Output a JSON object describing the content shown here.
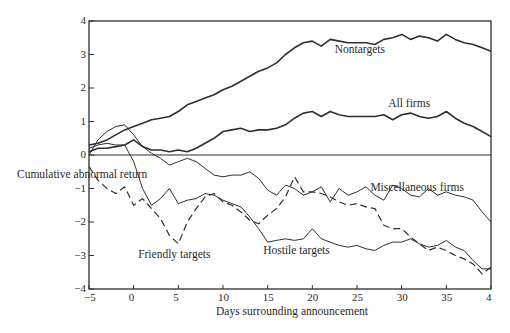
{
  "chart_data": {
    "type": "line",
    "title": "",
    "xlabel": "Days surrounding announcement",
    "ylabel": "Cumulative abnormal return",
    "xlim": [
      -5,
      40
    ],
    "ylim": [
      -4,
      4
    ],
    "x_ticks": [
      -5,
      0,
      5,
      10,
      15,
      20,
      25,
      30,
      35,
      40
    ],
    "x_tick_labels": [
      "−5",
      "0",
      "5",
      "10",
      "15",
      "20",
      "25",
      "30",
      "35",
      "4"
    ],
    "y_ticks": [
      4,
      3,
      2,
      1,
      0,
      -1,
      -2,
      -3,
      -4
    ],
    "y_tick_labels": [
      "4",
      "3",
      "2",
      "1",
      "0",
      "−1",
      "−2",
      "−3",
      "−4"
    ],
    "grid": false,
    "legend": "inline annotations",
    "x": [
      -5,
      -4,
      -3,
      -2,
      -1,
      0,
      1,
      2,
      3,
      4,
      5,
      6,
      7,
      8,
      9,
      10,
      11,
      12,
      13,
      14,
      15,
      16,
      17,
      18,
      19,
      20,
      21,
      22,
      23,
      24,
      25,
      26,
      27,
      28,
      29,
      30,
      31,
      32,
      33,
      34,
      35,
      36,
      37,
      38,
      39,
      40
    ],
    "series": [
      {
        "name": "Nontargets",
        "style": "solid",
        "width": 1.6,
        "values": [
          0.3,
          0.35,
          0.45,
          0.6,
          0.75,
          0.85,
          0.95,
          1.05,
          1.1,
          1.15,
          1.3,
          1.5,
          1.6,
          1.7,
          1.8,
          1.95,
          2.05,
          2.2,
          2.35,
          2.5,
          2.6,
          2.75,
          3.0,
          3.2,
          3.35,
          3.4,
          3.25,
          3.45,
          3.4,
          3.35,
          3.35,
          3.35,
          3.3,
          3.45,
          3.5,
          3.6,
          3.45,
          3.55,
          3.5,
          3.4,
          3.6,
          3.45,
          3.35,
          3.3,
          3.2,
          3.1
        ],
        "label": {
          "text": "Nontargets",
          "x": 22.5,
          "y": 3.15
        }
      },
      {
        "name": "All firms",
        "style": "solid",
        "width": 1.6,
        "values": [
          0.1,
          0.2,
          0.2,
          0.25,
          0.3,
          0.45,
          0.25,
          0.15,
          0.15,
          0.1,
          0.15,
          0.1,
          0.2,
          0.35,
          0.5,
          0.7,
          0.75,
          0.8,
          0.7,
          0.75,
          0.75,
          0.8,
          0.9,
          1.1,
          1.25,
          1.3,
          1.15,
          1.3,
          1.2,
          1.15,
          1.15,
          1.15,
          1.15,
          1.2,
          1.05,
          1.2,
          1.25,
          1.15,
          1.1,
          1.15,
          1.3,
          1.1,
          0.95,
          0.85,
          0.7,
          0.55
        ],
        "label": {
          "text": "All firms",
          "x": 28.5,
          "y": 1.55
        }
      },
      {
        "name": "Miscellaneous firms",
        "style": "solid",
        "width": 1.0,
        "values": [
          0.0,
          0.45,
          0.7,
          0.85,
          0.9,
          0.6,
          0.25,
          0.05,
          -0.1,
          -0.3,
          -0.2,
          -0.1,
          -0.2,
          -0.4,
          -0.6,
          -0.65,
          -0.6,
          -0.6,
          -0.5,
          -0.7,
          -1.05,
          -1.2,
          -0.9,
          -1.0,
          -1.2,
          -1.1,
          -0.95,
          -1.4,
          -1.0,
          -1.2,
          -1.1,
          -0.95,
          -1.2,
          -1.35,
          -0.9,
          -1.0,
          -1.2,
          -1.25,
          -1.0,
          -1.2,
          -1.1,
          -1.2,
          -1.25,
          -1.35,
          -1.7,
          -2.0
        ],
        "label": {
          "text": "Miscellaneous firms",
          "x": 26.5,
          "y": -0.95
        }
      },
      {
        "name": "Friendly targets",
        "style": "dashed",
        "width": 1.2,
        "values": [
          -0.35,
          -0.75,
          -1.0,
          -1.15,
          -0.95,
          -1.5,
          -1.3,
          -1.6,
          -1.9,
          -2.4,
          -2.65,
          -2.0,
          -1.6,
          -1.25,
          -1.15,
          -1.4,
          -1.5,
          -1.7,
          -1.95,
          -2.05,
          -1.8,
          -1.6,
          -1.25,
          -0.65,
          -1.1,
          -1.1,
          -1.15,
          -1.25,
          -1.4,
          -1.5,
          -1.45,
          -1.55,
          -1.6,
          -2.1,
          -2.2,
          -2.2,
          -2.45,
          -2.65,
          -2.85,
          -2.75,
          -2.85,
          -3.0,
          -3.1,
          -3.25,
          -3.55,
          -3.35
        ],
        "label": {
          "text": "Friendly targets",
          "x": 0.5,
          "y": -2.95
        }
      },
      {
        "name": "Hostile targets",
        "style": "solid",
        "width": 1.0,
        "values": [
          0.2,
          0.3,
          0.35,
          0.3,
          0.3,
          -0.2,
          -1.0,
          -1.5,
          -1.3,
          -1.0,
          -1.45,
          -1.35,
          -1.3,
          -1.15,
          -1.2,
          -1.35,
          -1.45,
          -1.55,
          -1.85,
          -2.2,
          -2.6,
          -2.55,
          -2.5,
          -2.55,
          -2.5,
          -2.2,
          -2.5,
          -2.6,
          -2.7,
          -2.75,
          -2.7,
          -2.8,
          -2.85,
          -2.7,
          -2.6,
          -2.6,
          -2.5,
          -2.65,
          -2.75,
          -2.7,
          -2.55,
          -2.75,
          -2.85,
          -3.15,
          -3.4,
          -3.4
        ],
        "label": {
          "text": "Hostile targets",
          "x": 14.5,
          "y": -2.85
        }
      }
    ]
  }
}
